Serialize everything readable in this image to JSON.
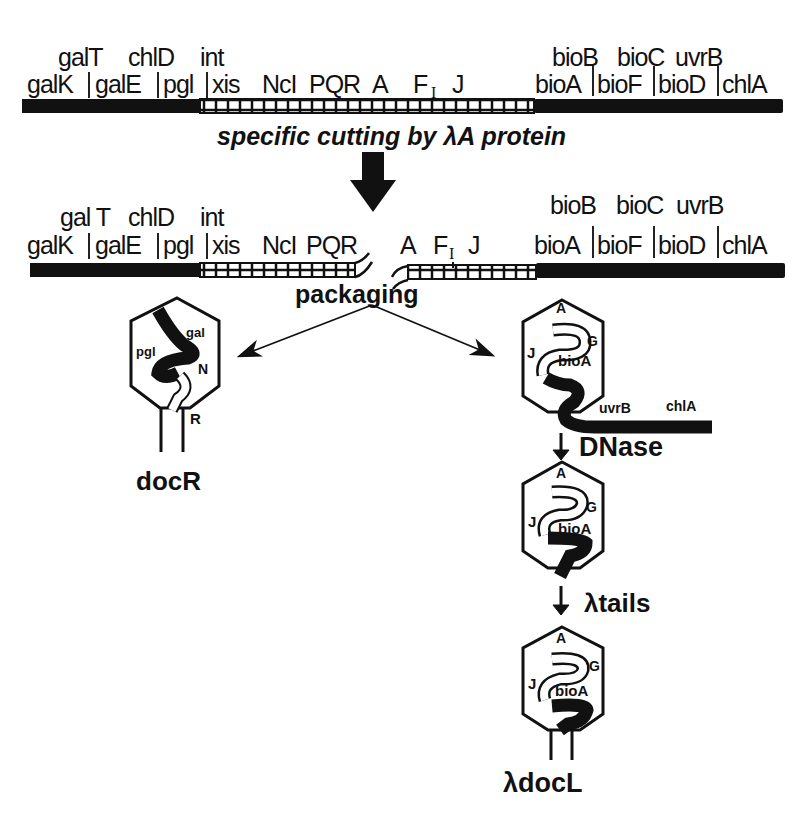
{
  "figure": {
    "top_map": {
      "upper_labels": [
        "galT",
        "chlD",
        "int",
        "bioB",
        "bioC",
        "uvrB"
      ],
      "lower_labels": [
        "galK",
        "galE",
        "pgl",
        "xis",
        "NcI",
        "PQR",
        "A",
        "F",
        "I",
        "J",
        "bioA",
        "bioF",
        "bioD",
        "chlA"
      ]
    },
    "cut_step": {
      "label": "specific cutting by λA protein"
    },
    "cut_map": {
      "upper_labels": [
        "gal T",
        "chlD",
        "int",
        "bioB",
        "bioC",
        "uvrB"
      ],
      "lower_left_labels": [
        "galK",
        "galE",
        "pgl",
        "xis",
        "NcI",
        "PQR"
      ],
      "lower_right_labels": [
        "A",
        "F",
        "I",
        "J",
        "bioA",
        "bioF",
        "bioD",
        "chlA"
      ]
    },
    "packaging_label": "packaging",
    "left_phage": {
      "labels": [
        "gal",
        "pgl",
        "N",
        "R"
      ],
      "name": "docR"
    },
    "right_phage_1": {
      "labels": [
        "A",
        "G",
        "J",
        "bioA",
        "uvrB",
        "chlA"
      ]
    },
    "step_dnase": "DNase",
    "right_phage_2": {
      "labels": [
        "A",
        "G",
        "J",
        "bioA"
      ]
    },
    "step_tails": "λtails",
    "right_phage_3": {
      "labels": [
        "A",
        "G",
        "J",
        "bioA"
      ],
      "name": "λdocL"
    }
  }
}
